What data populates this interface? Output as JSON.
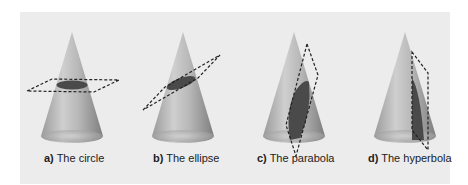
{
  "figure": {
    "panels": [
      {
        "letter": "a)",
        "label": "The circle",
        "section": "circle"
      },
      {
        "letter": "b)",
        "label": "The ellipse",
        "section": "ellipse"
      },
      {
        "letter": "c)",
        "label": "The parabola",
        "section": "parabola"
      },
      {
        "letter": "d)",
        "label": "The hyperbola",
        "section": "hyperbola"
      }
    ],
    "colors": {
      "background": "#ececec",
      "cone_light": "#c8c8c8",
      "cone_dark": "#8a8a8a",
      "section_fill": "#4a4a4a",
      "plane_stroke": "#222222"
    }
  }
}
